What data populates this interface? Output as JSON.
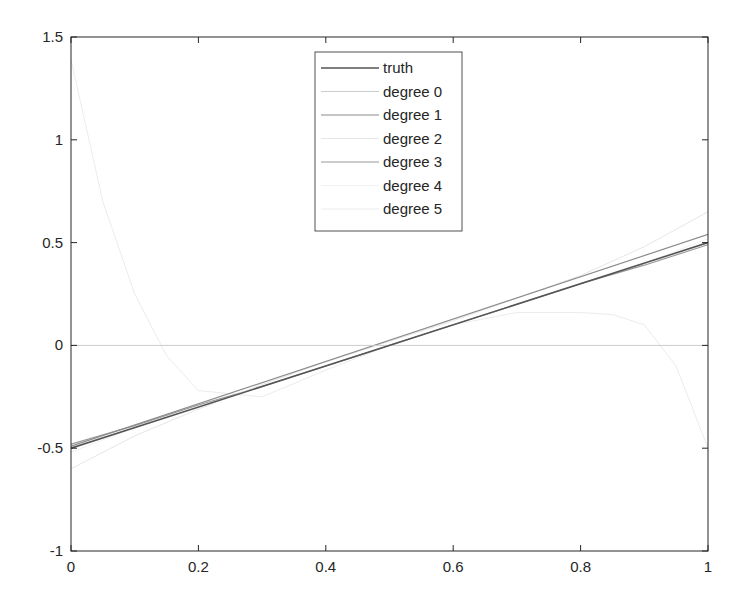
{
  "chart_data": {
    "type": "line",
    "title": "",
    "xlabel": "",
    "ylabel": "",
    "xlim": [
      0,
      1
    ],
    "ylim": [
      -1,
      1.5
    ],
    "xticks": [
      0,
      0.2,
      0.4,
      0.6,
      0.8,
      1
    ],
    "xtick_labels": [
      "0",
      "0.2",
      "0.4",
      "0.6",
      "0.8",
      "1"
    ],
    "yticks": [
      -1,
      -0.5,
      0,
      0.5,
      1,
      1.5
    ],
    "ytick_labels": [
      "-1",
      "-0.5",
      "0",
      "0.5",
      "1",
      "1.5"
    ],
    "grid": false,
    "legend_position": "top-center",
    "series": [
      {
        "name": "truth",
        "color": "#555555",
        "width": 1.6,
        "x": [
          0,
          1
        ],
        "y": [
          -0.5,
          0.5
        ]
      },
      {
        "name": "degree 0",
        "color": "#cccccc",
        "width": 1,
        "x": [
          0,
          1
        ],
        "y": [
          0,
          0
        ]
      },
      {
        "name": "degree 1",
        "color": "#8c8c8c",
        "width": 1.2,
        "x": [
          0,
          1
        ],
        "y": [
          -0.49,
          0.54
        ]
      },
      {
        "name": "degree 2",
        "color": "#e6e6e6",
        "width": 1,
        "x": [
          0,
          0.1,
          0.2,
          0.3,
          0.4,
          0.5,
          0.6,
          0.7,
          0.8,
          0.9,
          1
        ],
        "y": [
          -0.6,
          -0.44,
          -0.31,
          -0.19,
          -0.08,
          0.02,
          0.12,
          0.23,
          0.34,
          0.48,
          0.65
        ]
      },
      {
        "name": "degree 3",
        "color": "#9a9a9a",
        "width": 1.2,
        "x": [
          0,
          0.1,
          0.2,
          0.3,
          0.4,
          0.5,
          0.6,
          0.7,
          0.8,
          0.9,
          1
        ],
        "y": [
          -0.48,
          -0.39,
          -0.29,
          -0.2,
          -0.1,
          0.0,
          0.1,
          0.2,
          0.3,
          0.39,
          0.49
        ]
      },
      {
        "name": "degree 4",
        "color": "#f2f2f2",
        "width": 1,
        "x": [
          0,
          0.1,
          0.2,
          0.3,
          0.4,
          0.5,
          0.6,
          0.7,
          0.8,
          0.9,
          1
        ],
        "y": [
          -0.52,
          -0.4,
          -0.3,
          -0.2,
          -0.1,
          0.0,
          0.1,
          0.2,
          0.3,
          0.4,
          0.52
        ]
      },
      {
        "name": "degree 5",
        "color": "#ececec",
        "width": 1,
        "x": [
          0,
          0.05,
          0.1,
          0.15,
          0.2,
          0.3,
          0.4,
          0.5,
          0.6,
          0.7,
          0.8,
          0.85,
          0.9,
          0.95,
          1
        ],
        "y": [
          1.39,
          0.7,
          0.25,
          -0.05,
          -0.22,
          -0.25,
          -0.12,
          0.0,
          0.1,
          0.16,
          0.16,
          0.15,
          0.1,
          -0.1,
          -0.5
        ]
      }
    ]
  },
  "legend": {
    "items": [
      {
        "label": "truth"
      },
      {
        "label": "degree 0"
      },
      {
        "label": "degree 1"
      },
      {
        "label": "degree 2"
      },
      {
        "label": "degree 3"
      },
      {
        "label": "degree 4"
      },
      {
        "label": "degree 5"
      }
    ]
  }
}
